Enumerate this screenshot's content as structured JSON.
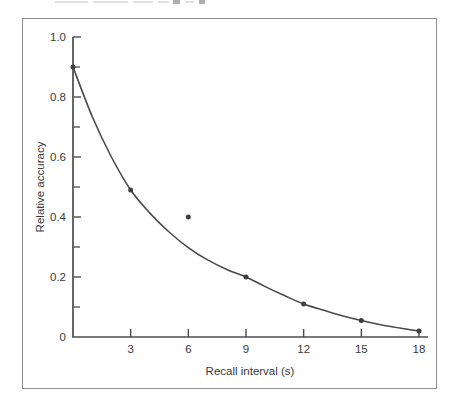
{
  "top_cropped_text": {
    "legible": false,
    "description": "bottom sliver of a cropped caption line"
  },
  "chart_data": {
    "type": "line",
    "title": "",
    "xlabel": "Recall interval (s)",
    "ylabel": "Relative accuracy",
    "xlim": [
      0,
      18.5
    ],
    "ylim": [
      0,
      1.0
    ],
    "grid": false,
    "legend": false,
    "x_ticks": [
      3,
      6,
      9,
      12,
      15,
      18
    ],
    "x_tick_labels": [
      "3",
      "6",
      "9",
      "12",
      "15",
      "18"
    ],
    "y_ticks": [
      0,
      0.2,
      0.4,
      0.6,
      0.8,
      1.0
    ],
    "y_tick_labels": [
      "0",
      "0.2",
      "0.4",
      "0.6",
      "0.8",
      "1.0"
    ],
    "y_minor_ticks": [
      0.1,
      0.3,
      0.5,
      0.7,
      0.9
    ],
    "points": [
      {
        "x": 0,
        "y": 0.9,
        "on_curve": true
      },
      {
        "x": 3,
        "y": 0.49,
        "on_curve": true
      },
      {
        "x": 6,
        "y": 0.4,
        "on_curve": false
      },
      {
        "x": 9,
        "y": 0.2,
        "on_curve": true
      },
      {
        "x": 12,
        "y": 0.11,
        "on_curve": true
      },
      {
        "x": 15,
        "y": 0.055,
        "on_curve": true
      },
      {
        "x": 18,
        "y": 0.02,
        "on_curve": true
      }
    ],
    "curve": {
      "shape": "exponential-decay",
      "samples_x": [
        0,
        1,
        2,
        3,
        4,
        5,
        6,
        7,
        8,
        9,
        10,
        11,
        12,
        13,
        14,
        15,
        16,
        17,
        18
      ],
      "samples_y": [
        0.9,
        0.735,
        0.6,
        0.49,
        0.413,
        0.35,
        0.298,
        0.257,
        0.225,
        0.2,
        0.168,
        0.138,
        0.11,
        0.09,
        0.071,
        0.055,
        0.041,
        0.03,
        0.02
      ]
    }
  },
  "colors": {
    "curve": "#4a4a4a",
    "point": "#3f3f3f",
    "axis": "#4d4d4d",
    "text": "#3a3a3a",
    "frame_border": "#8e8e8e",
    "background": "#ffffff"
  }
}
